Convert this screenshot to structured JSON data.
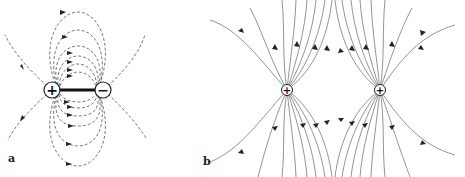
{
  "panels": [
    {
      "id": "a",
      "label": "a",
      "description": "Electric dipole field lines (dashed)",
      "charges": [
        {
          "sign": "+",
          "symbol": "+",
          "x": 52,
          "y": 90
        },
        {
          "sign": "-",
          "symbol": "−",
          "x": 103,
          "y": 90
        }
      ],
      "line_style": "dashed"
    },
    {
      "id": "b",
      "label": "b",
      "description": "Field lines of two equal positive charges (solid)",
      "charges": [
        {
          "sign": "+",
          "symbol": "+",
          "x": 287,
          "y": 90
        },
        {
          "sign": "+",
          "symbol": "+",
          "x": 380,
          "y": 90
        }
      ],
      "line_style": "solid"
    }
  ],
  "colors": {
    "line": "#555555",
    "charge_stroke": "#222222",
    "rod": "#111111",
    "background": "#ffffff"
  }
}
